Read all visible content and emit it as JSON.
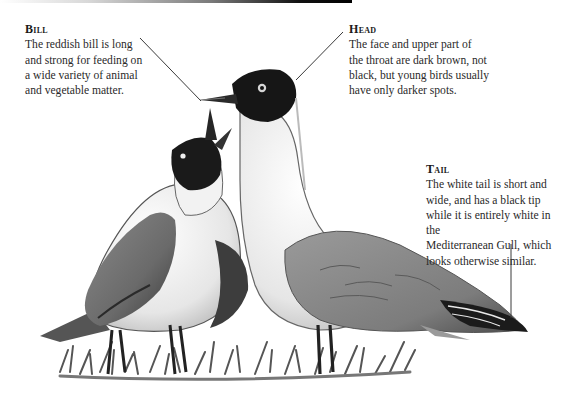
{
  "figure": {
    "accent_line_color": "#3a3a3a"
  },
  "callouts": {
    "bill": {
      "title": "Bill",
      "body": "The reddish bill is long\nand strong for feeding on\na wide variety of animal\nand vegetable matter."
    },
    "head": {
      "title": "Head",
      "body": "The face and upper part of\nthe throat are dark brown, not\nblack, but young birds usually\nhave only darker spots."
    },
    "tail": {
      "title": "Tail",
      "body": "The white tail is short and\nwide, and has a black tip\nwhile it is entirely white in the\nMediterranean Gull, which\nlooks otherwise similar."
    }
  }
}
